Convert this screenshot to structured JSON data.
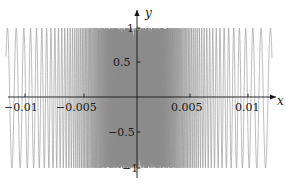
{
  "figure": {
    "background": "#ffffff",
    "width": 286,
    "height": 186
  },
  "axes": {
    "x_name": "x",
    "y_name": "y",
    "axis_color": "#141414",
    "x_axis_pixel_y": 97,
    "y_axis_pixel_x": 137,
    "x_ticks": [
      {
        "label": "−0.01",
        "value": -0.01,
        "px": 25
      },
      {
        "label": "−0.005",
        "value": -0.005,
        "px": 84
      },
      {
        "label": "0.005",
        "value": 0.005,
        "px": 190
      },
      {
        "label": "0.01",
        "value": 0.01,
        "px": 248
      }
    ],
    "y_ticks": [
      {
        "label": "1",
        "value": 1,
        "py": 28
      },
      {
        "label": "0.5",
        "value": 0.5,
        "py": 62
      },
      {
        "label": "−0.5",
        "value": -0.5,
        "py": 132
      },
      {
        "label": "−1",
        "value": -1,
        "py": 168
      }
    ]
  },
  "chart_data": {
    "type": "line",
    "title": "",
    "xlabel": "x",
    "ylabel": "y",
    "xlim": [
      -0.0123,
      0.0123
    ],
    "ylim": [
      -1.12,
      1.12
    ],
    "grid": false,
    "legend": null,
    "curve_color": "#8c8c8c",
    "curve_linewidth": 0.6,
    "function": "sin(1/x)",
    "samples": 9000,
    "xtick_values": [
      -0.01,
      -0.005,
      0.005,
      0.01
    ],
    "ytick_values": [
      1,
      0.5,
      -0.5,
      -1
    ]
  }
}
